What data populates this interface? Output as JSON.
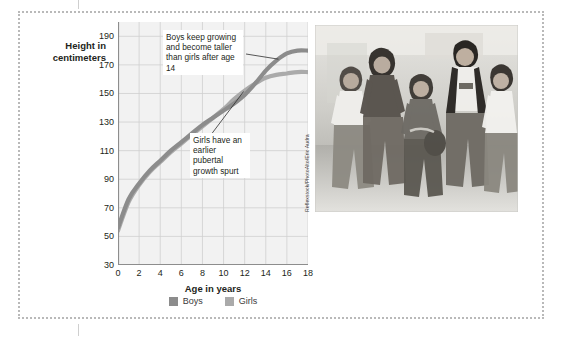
{
  "figure": {
    "y_axis_title": "Height in\ncentimeters",
    "x_axis_title": "Age in years"
  },
  "annotations": {
    "boys_note": "Boys keep growing and become taller than girls after age 14",
    "girls_note": "Girls have an earlier pubertal growth spurt"
  },
  "legend": {
    "items": [
      {
        "label": "Boys",
        "color": "#8c8c8c"
      },
      {
        "label": "Girls",
        "color": "#aaaaaa"
      }
    ]
  },
  "photo": {
    "credit": "Reflexstock/PhotoAlto/Eric Audra",
    "alt_name": "group-of-teenagers-walking"
  },
  "chart_data": {
    "type": "line",
    "title": "",
    "xlabel": "Age in years",
    "ylabel": "Height in centimeters",
    "xlim": [
      0,
      18
    ],
    "ylim": [
      30,
      200
    ],
    "xticks": [
      0,
      2,
      4,
      6,
      8,
      10,
      12,
      14,
      16,
      18
    ],
    "yticks": [
      30,
      50,
      70,
      90,
      110,
      130,
      150,
      170,
      190
    ],
    "grid": true,
    "legend_position": "bottom-center",
    "x": [
      0,
      1,
      2,
      3,
      4,
      5,
      6,
      7,
      8,
      9,
      10,
      11,
      12,
      13,
      14,
      15,
      16,
      17,
      18
    ],
    "series": [
      {
        "name": "Boys",
        "color": "#8c8c8c",
        "values": [
          56,
          76,
          87,
          96,
          103,
          110,
          116,
          122,
          128,
          133,
          138,
          143,
          149,
          157,
          166,
          173,
          178,
          180,
          180
        ]
      },
      {
        "name": "Girls",
        "color": "#aaaaaa",
        "values": [
          54,
          74,
          86,
          95,
          102,
          109,
          115,
          121,
          127,
          133,
          139,
          146,
          152,
          157,
          161,
          163,
          164,
          165,
          165
        ]
      }
    ],
    "annotations": [
      {
        "text": "Boys keep growing and become taller than girls after age 14",
        "points_to_series": "Boys",
        "points_to_x": 15.5
      },
      {
        "text": "Girls have an earlier pubertal growth spurt",
        "points_to_series": "Girls",
        "points_to_x": 12
      }
    ]
  }
}
